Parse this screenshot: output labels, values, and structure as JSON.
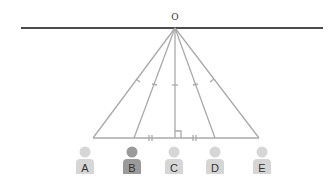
{
  "diagram": {
    "apex_label": "O",
    "people": [
      {
        "label": "A",
        "x": 93,
        "highlighted": false
      },
      {
        "label": "B",
        "x": 134,
        "highlighted": true
      },
      {
        "label": "C",
        "x": 175,
        "highlighted": false
      },
      {
        "label": "D",
        "x": 215,
        "highlighted": false
      },
      {
        "label": "E",
        "x": 259,
        "highlighted": false
      }
    ],
    "colors": {
      "line": "#111111",
      "ray": "#aaaaaa",
      "person": "#d6d6d6",
      "person_highlight": "#9a9a9a"
    }
  }
}
